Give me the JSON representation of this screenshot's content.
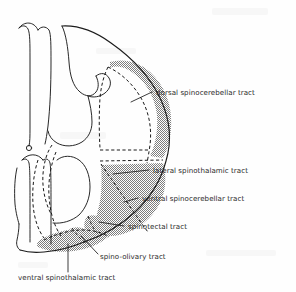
{
  "figure": {
    "type": "anatomical-diagram",
    "background_color": "#fefefe",
    "ink_color": "#1c1c1c",
    "shade_color": "#8a8a8a",
    "text_color": "#2b2b2b"
  },
  "labels": {
    "dorsal_spinocerebellar": "dorsal spinocerebellar tract",
    "lateral_spinothalamic": "lateral spinothalamic tract",
    "ventral_spinocerebellar": "ventral spinocerebellar tract",
    "spinotectal": "spinotectal tract",
    "spino_olivary": "spino-olivary tract",
    "ventral_spinothalamic": "ventral spinothalamic tract"
  },
  "label_list": [
    "dorsal spinocerebellar tract",
    "lateral spinothalamic tract",
    "ventral spinocerebellar tract",
    "spinotectal tract",
    "spino-olivary tract",
    "ventral spinothalamic tract"
  ]
}
